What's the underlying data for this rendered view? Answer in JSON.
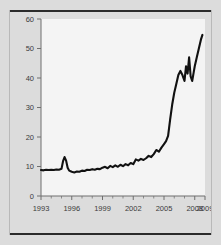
{
  "figure": {
    "background_color": "#dcdcdc",
    "plot_background_color": "#f4f4f4",
    "line_color": "#111111",
    "axis_color": "#6f6f6f",
    "rule_color": "#2b2b2b"
  },
  "chart_data": {
    "type": "line",
    "title": "",
    "subtitle": "",
    "xlabel": "",
    "ylabel": "",
    "xlim": [
      1993,
      2009
    ],
    "ylim": [
      0,
      60
    ],
    "grid": false,
    "legend": null,
    "y_ticks": [
      0,
      10,
      20,
      30,
      40,
      50,
      60
    ],
    "y_tick_labels": [
      "0",
      "10",
      "20",
      "30",
      "40",
      "50",
      "60"
    ],
    "x_ticks": [
      1993,
      1994,
      1995,
      1996,
      1997,
      1998,
      1999,
      2000,
      2001,
      2002,
      2003,
      2004,
      2005,
      2006,
      2007,
      2008,
      2009
    ],
    "x_tick_labels_shown": [
      "1993",
      "1996",
      "1999",
      "2002",
      "2005",
      "2008",
      "2009"
    ],
    "x_labeled_ticks": [
      1993,
      1996,
      1999,
      2002,
      2005,
      2008,
      2009
    ],
    "series": [
      {
        "name": "series-1",
        "x": [
          1993.0,
          1993.25,
          1993.5,
          1993.75,
          1994.0,
          1994.25,
          1994.5,
          1994.75,
          1995.0,
          1995.15,
          1995.3,
          1995.45,
          1995.6,
          1995.75,
          1996.0,
          1996.25,
          1996.5,
          1996.75,
          1997.0,
          1997.25,
          1997.5,
          1997.75,
          1998.0,
          1998.25,
          1998.5,
          1998.75,
          1999.0,
          1999.25,
          1999.5,
          1999.75,
          2000.0,
          2000.25,
          2000.5,
          2000.75,
          2001.0,
          2001.25,
          2001.5,
          2001.75,
          2002.0,
          2002.25,
          2002.5,
          2002.75,
          2003.0,
          2003.25,
          2003.5,
          2003.75,
          2004.0,
          2004.25,
          2004.5,
          2004.75,
          2005.0,
          2005.2,
          2005.4,
          2005.6,
          2005.8,
          2006.0,
          2006.2,
          2006.4,
          2006.6,
          2006.8,
          2007.0,
          2007.15,
          2007.3,
          2007.45,
          2007.6,
          2007.75,
          2007.9,
          2008.0,
          2008.2,
          2008.4,
          2008.6,
          2008.75
        ],
        "y": [
          8.8,
          8.7,
          8.9,
          8.8,
          8.9,
          8.8,
          9.0,
          8.9,
          9.2,
          11.8,
          13.2,
          12.0,
          9.6,
          8.6,
          8.2,
          8.0,
          8.3,
          8.2,
          8.6,
          8.5,
          8.9,
          8.8,
          9.1,
          8.9,
          9.2,
          9.1,
          9.6,
          9.9,
          9.4,
          10.2,
          9.8,
          10.4,
          9.9,
          10.6,
          10.1,
          10.8,
          10.4,
          11.2,
          10.8,
          12.4,
          12.0,
          12.6,
          12.2,
          12.8,
          13.6,
          13.2,
          14.2,
          15.6,
          15.0,
          16.4,
          17.6,
          18.6,
          20.4,
          26.0,
          31.0,
          35.0,
          38.0,
          41.0,
          42.4,
          41.0,
          39.0,
          44.0,
          41.5,
          47.0,
          40.5,
          39.0,
          42.0,
          44.0,
          47.0,
          50.0,
          53.0,
          54.6
        ]
      }
    ],
    "annotations": [],
    "peak_value": 54.6,
    "minimum_value": 8.0
  }
}
